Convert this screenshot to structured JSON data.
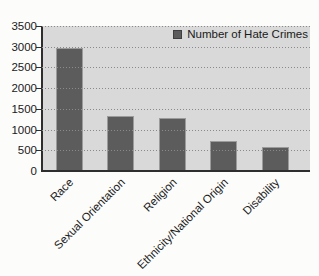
{
  "chart_data": {
    "type": "bar",
    "title": "",
    "xlabel": "",
    "ylabel": "",
    "legend": "Number of Hate Crimes",
    "legend_position": "top-right",
    "categories": [
      "Race",
      "Sexual Orientation",
      "Religion",
      "Ethnicity/National Origin",
      "Disability"
    ],
    "values": [
      2950,
      1300,
      1250,
      700,
      560
    ],
    "ylim": [
      0,
      3500
    ],
    "yticks": [
      0,
      500,
      1000,
      1500,
      2000,
      2500,
      3000,
      3500
    ],
    "grid": "horizontal-dotted",
    "x_tick_label_rotation_deg": 45
  },
  "colors": {
    "bar": "#5c5c5c",
    "plot_background": "#d9d9d9",
    "gridline": "#8a8a8a",
    "axis": "#2e2e2e",
    "text": "#1a1a1a",
    "page_background": "#fcfcfa"
  }
}
